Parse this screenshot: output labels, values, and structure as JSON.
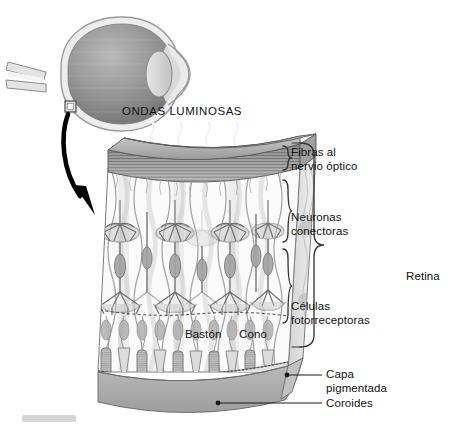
{
  "figure": {
    "title_text": "ONDAS LUMINOSAS",
    "language": "es"
  },
  "labels": {
    "light_waves": "ONDAS LUMINOSAS",
    "nerve_fibers_l1": "Fibras al",
    "nerve_fibers_l2": "nervio óptico",
    "connecting_neurons_l1": "Neuronas",
    "connecting_neurons_l2": "conectoras",
    "photoreceptors_l1": "Células",
    "photoreceptors_l2": "fotorreceptoras",
    "retina": "Retina",
    "rod": "Bastón",
    "cone": "Cono",
    "pigment_layer_l1": "Capa",
    "pigment_layer_l2": "pigmentada",
    "choroid": "Coroides"
  },
  "eye_diagram": {
    "name": "eyeball-cross-section",
    "parts": [
      "sclera",
      "choroid-interior",
      "lens",
      "cornea",
      "optic-nerve",
      "callout-box"
    ]
  },
  "block": {
    "name": "retina-block-3d",
    "layers": [
      {
        "key": "nerve-fiber-layer",
        "label": "Fibras al nervio óptico"
      },
      {
        "key": "connecting-neuron-layer",
        "label": "Neuronas conectoras"
      },
      {
        "key": "photoreceptor-layer",
        "label": "Células fotorreceptoras"
      },
      {
        "key": "pigmented-epithelium",
        "label": "Capa pigmentada"
      },
      {
        "key": "choroid",
        "label": "Coroides"
      }
    ],
    "light_wave_count": 4,
    "photoreceptor_columns": 10
  },
  "colors": {
    "background": "#ffffff",
    "ink": "#1a1a1a",
    "line": "#555555",
    "gray_dark": "#8e8e8e",
    "gray_mid": "#b4b4b4",
    "gray_light": "#d8d8d8",
    "gray_pale": "#ededed",
    "cell_gray": "#a8a8a8",
    "arrow_black": "#000000"
  }
}
